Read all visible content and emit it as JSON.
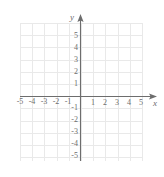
{
  "figure": {
    "kind": "cartesian-coordinate-plane",
    "axis_label_x": "x",
    "axis_label_y": "y",
    "grid_color": "#e9e9e9",
    "axis_color": "#6d6d6d",
    "label_color": "#6d6d6d",
    "background": "#ffffff"
  },
  "chart_data": {
    "type": "scatter",
    "title": "",
    "xlabel": "x",
    "ylabel": "y",
    "xlim": [
      -6,
      6
    ],
    "ylim": [
      -6,
      6
    ],
    "grid": true,
    "legend": "none",
    "x_ticks": [
      -5,
      -4,
      -3,
      -2,
      -1,
      1,
      2,
      3,
      4,
      5
    ],
    "y_ticks": [
      5,
      4,
      3,
      2,
      1,
      -1,
      -2,
      -3,
      -4,
      -5
    ],
    "x_tick_labels": [
      "-5",
      "-4",
      "-3",
      "-2",
      "-1",
      "1",
      "2",
      "3",
      "4",
      "5"
    ],
    "y_tick_labels": [
      "5",
      "4",
      "3",
      "2",
      "1",
      "-1",
      "-2",
      "-3",
      "-4",
      "-5"
    ],
    "series": [],
    "annotations": []
  },
  "ticks": {
    "x_negative": [
      {
        "label": "-5",
        "value": -5
      },
      {
        "label": "-4",
        "value": -4
      },
      {
        "label": "-3",
        "value": -3
      },
      {
        "label": "-2",
        "value": -2
      },
      {
        "label": "-1",
        "value": -1
      }
    ],
    "x_positive": [
      {
        "label": "1",
        "value": 1
      },
      {
        "label": "2",
        "value": 2
      },
      {
        "label": "3",
        "value": 3
      },
      {
        "label": "4",
        "value": 4
      },
      {
        "label": "5",
        "value": 5
      }
    ],
    "y_positive": [
      {
        "label": "5",
        "value": 5
      },
      {
        "label": "4",
        "value": 4
      },
      {
        "label": "3",
        "value": 3
      },
      {
        "label": "2",
        "value": 2
      },
      {
        "label": "1",
        "value": 1
      }
    ],
    "y_negative": [
      {
        "label": "-1",
        "value": -1
      },
      {
        "label": "-2",
        "value": -2
      },
      {
        "label": "-3",
        "value": -3
      },
      {
        "label": "-4",
        "value": -4
      },
      {
        "label": "-5",
        "value": -5
      }
    ]
  }
}
